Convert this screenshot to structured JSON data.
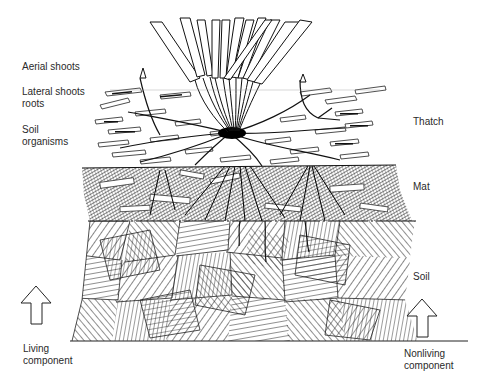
{
  "diagram": {
    "left_labels": {
      "aerial_shoots": "Aerial shoots",
      "lateral_shoots_line1": "Lateral shoots",
      "lateral_shoots_line2": "roots",
      "soil_organisms_line1": "Soil",
      "soil_organisms_line2": "organisms",
      "living_line1": "Living",
      "living_line2": "component"
    },
    "right_labels": {
      "thatch": "Thatch",
      "mat": "Mat",
      "soil": "Soil",
      "nonliving_line1": "Nonliving",
      "nonliving_line2": "component"
    },
    "layers": [
      {
        "name": "Thatch",
        "top_y": 90,
        "bottom_y": 166
      },
      {
        "name": "Mat",
        "top_y": 166,
        "bottom_y": 221
      },
      {
        "name": "Soil",
        "top_y": 221,
        "bottom_y": 341
      }
    ],
    "arrows": [
      {
        "name": "living-component-arrow",
        "direction": "up"
      },
      {
        "name": "nonliving-component-arrow",
        "direction": "up"
      }
    ],
    "colors": {
      "ink": "#1a1a1a",
      "paper": "#ffffff",
      "text": "#2a2a2a"
    }
  }
}
